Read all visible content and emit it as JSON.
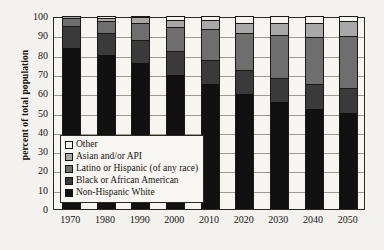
{
  "chart_data": {
    "type": "bar",
    "stacked": true,
    "title": "",
    "xlabel": "",
    "ylabel": "percent of total population",
    "ylim": [
      0,
      100
    ],
    "ytick_labels": [
      "100",
      "90",
      "80",
      "70",
      "60",
      "50",
      "40",
      "30",
      "20",
      "10",
      "0"
    ],
    "yticks": [
      100,
      90,
      80,
      70,
      60,
      50,
      40,
      30,
      20,
      10,
      0
    ],
    "grid": true,
    "legend_position": "inner-lower-left",
    "categories": [
      "1970",
      "1980",
      "1990",
      "2000",
      "2010",
      "2020",
      "2030",
      "2040",
      "2050"
    ],
    "series": [
      {
        "name": "Non-Hispanic White",
        "color": "#111111",
        "swatch": "#111111",
        "values": [
          83.5,
          79.6,
          75.7,
          69.5,
          64.7,
          59.7,
          55.5,
          51.8,
          49.9
        ]
      },
      {
        "name": "Black or African American",
        "color": "#3a3a3a",
        "swatch": "#3a3a3a",
        "values": [
          11.1,
          11.5,
          11.8,
          12.3,
          12.4,
          12.4,
          12.6,
          12.8,
          12.9
        ]
      },
      {
        "name": "Latino or Hispanic (of any race)",
        "color": "#6e6e6e",
        "swatch": "#6e6e6e",
        "values": [
          4.6,
          6.4,
          9.0,
          12.5,
          16.0,
          18.9,
          21.9,
          24.4,
          26.6
        ]
      },
      {
        "name": "Asian and/or API",
        "color": "#a8a8a8",
        "swatch": "#a8a8a8",
        "values": [
          0.8,
          1.6,
          2.8,
          3.8,
          4.7,
          5.6,
          6.5,
          7.3,
          7.9
        ]
      },
      {
        "name": "Other",
        "color": "#f4f3f0",
        "swatch": "#f4f3f0",
        "values": [
          0.0,
          0.9,
          0.7,
          1.9,
          2.2,
          3.4,
          3.5,
          3.7,
          2.7
        ]
      }
    ]
  }
}
